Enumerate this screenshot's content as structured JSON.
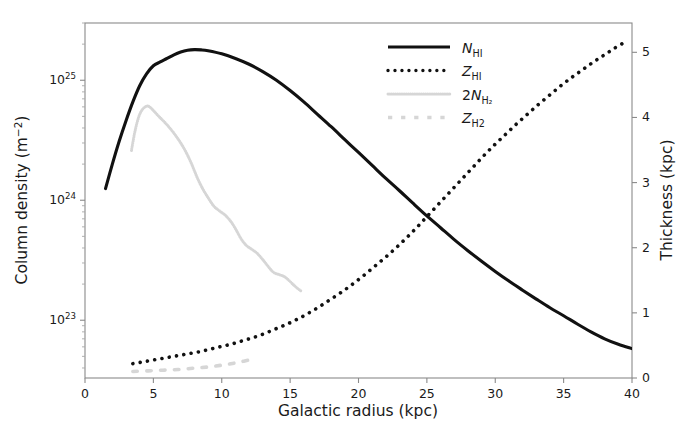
{
  "figure": {
    "background_color": "#ffffff",
    "frame_color": "#8a8a8a",
    "width": 690,
    "height": 427
  },
  "axes": {
    "x": {
      "label": "Galactic radius (kpc)",
      "min": 0,
      "max": 40,
      "ticks": [
        0,
        5,
        10,
        15,
        20,
        25,
        30,
        35,
        40
      ],
      "ticklabels": [
        "0",
        "5",
        "10",
        "15",
        "20",
        "25",
        "30",
        "35",
        "40"
      ],
      "scale": "linear"
    },
    "y_left": {
      "label_main": "Column density (m",
      "label_sup": "−2",
      "label_close": ")",
      "label_full": "Column density (m−2)",
      "scale": "log",
      "min": 3.3e+22,
      "max": 3e+25,
      "ticks": [
        1e+23,
        1e+24,
        1e+25
      ],
      "ticklabels": [
        {
          "mantissa": "10",
          "exponent": "23"
        },
        {
          "mantissa": "10",
          "exponent": "24"
        },
        {
          "mantissa": "10",
          "exponent": "25"
        }
      ]
    },
    "y_right": {
      "label": "Thickness (kpc)",
      "scale": "linear",
      "min": 0,
      "max": 5.45,
      "ticks": [
        0,
        1,
        2,
        3,
        4,
        5
      ],
      "ticklabels": [
        "0",
        "1",
        "2",
        "3",
        "4",
        "5"
      ]
    }
  },
  "legend": {
    "position": "upper-center-right",
    "frame": false,
    "entries": [
      {
        "name": "N_HI",
        "symbol_italic": "N",
        "symbol_sub": "HI",
        "style": "solid",
        "color": "#111111",
        "linewidth": 3.0,
        "axis": "left"
      },
      {
        "name": "Z_HI",
        "symbol_italic": "Z",
        "symbol_sub": "HI",
        "style": "dotted",
        "color": "#111111",
        "linewidth": 3.4,
        "axis": "right"
      },
      {
        "name": "2N_H2",
        "symbol_prefix": "2",
        "symbol_italic": "N",
        "symbol_sub": "H₂",
        "style": "dense-dotted",
        "color": "#d6d6d6",
        "linewidth": 3.0,
        "axis": "left"
      },
      {
        "name": "Z_H2",
        "symbol_italic": "Z",
        "symbol_sub": "H2",
        "style": "dashed",
        "color": "#d6d6d6",
        "linewidth": 3.4,
        "axis": "right"
      }
    ]
  },
  "chart_data": {
    "type": "line",
    "title": "",
    "xlabel": "Galactic radius (kpc)",
    "ylabel": "Column density (m^-2)",
    "ylabel_right": "Thickness (kpc)",
    "xlim": [
      0,
      40
    ],
    "ylim_left_log": [
      3.3e+22,
      3e+25
    ],
    "ylim_right": [
      0,
      5.45
    ],
    "grid": false,
    "legend_position": "upper right",
    "series": [
      {
        "name": "N_HI",
        "label": "N_HI",
        "axis": "left",
        "style": "solid",
        "color": "#111111",
        "x": [
          1.5,
          2.0,
          2.5,
          3.0,
          3.5,
          4.0,
          4.5,
          5.0,
          5.5,
          6.0,
          6.5,
          7.0,
          7.5,
          8.0,
          8.5,
          9.0,
          10.0,
          11.0,
          12.0,
          13.0,
          14.0,
          15.0,
          16.0,
          17.0,
          18.0,
          19.0,
          20.0,
          21.0,
          22.0,
          23.0,
          24.0,
          25.0,
          26.0,
          27.0,
          28.0,
          29.0,
          30.0,
          31.0,
          32.0,
          33.0,
          34.0,
          35.0,
          36.0,
          37.0,
          38.0,
          39.0,
          40.0
        ],
        "y": [
          1.25e+24,
          2e+24,
          3.1e+24,
          4.6e+24,
          6.6e+24,
          9e+24,
          1.13e+25,
          1.32e+25,
          1.42e+25,
          1.52e+25,
          1.63e+25,
          1.72e+25,
          1.78e+25,
          1.8e+25,
          1.79e+25,
          1.76e+25,
          1.66e+25,
          1.52e+25,
          1.36e+25,
          1.18e+25,
          1e+25,
          8.2e+24,
          6.6e+24,
          5.2e+24,
          4.1e+24,
          3.2e+24,
          2.5e+24,
          1.95e+24,
          1.52e+24,
          1.2e+24,
          9.4e+23,
          7.4e+23,
          5.9e+23,
          4.7e+23,
          3.8e+23,
          3.1e+23,
          2.55e+23,
          2.12e+23,
          1.78e+23,
          1.5e+23,
          1.27e+23,
          1.09e+23,
          9.3e+22,
          8e+22,
          7e+22,
          6.3e+22,
          5.8e+22
        ]
      },
      {
        "name": "Z_HI",
        "label": "Z_HI",
        "axis": "right",
        "style": "dotted",
        "color": "#111111",
        "x": [
          3.5,
          4.3,
          5.1,
          5.9,
          6.7,
          7.5,
          8.3,
          9.1,
          9.9,
          10.7,
          11.5,
          12.3,
          13.1,
          13.9,
          14.7,
          15.5,
          16.3,
          17.1,
          17.9,
          18.7,
          19.5,
          20.3,
          21.1,
          21.9,
          22.7,
          23.5,
          24.3,
          25.1,
          25.9,
          26.7,
          27.5,
          28.3,
          29.1,
          29.9,
          30.7,
          31.5,
          32.3,
          33.1,
          33.9,
          34.7,
          35.5,
          36.3,
          37.1,
          37.9,
          38.7,
          39.5
        ],
        "y": [
          0.22,
          0.25,
          0.28,
          0.31,
          0.34,
          0.37,
          0.4,
          0.44,
          0.48,
          0.52,
          0.57,
          0.62,
          0.68,
          0.75,
          0.82,
          0.9,
          0.99,
          1.09,
          1.2,
          1.31,
          1.43,
          1.56,
          1.7,
          1.84,
          1.99,
          2.15,
          2.32,
          2.5,
          2.68,
          2.86,
          3.04,
          3.22,
          3.4,
          3.57,
          3.73,
          3.89,
          4.04,
          4.19,
          4.33,
          4.47,
          4.6,
          4.72,
          4.84,
          4.95,
          5.06,
          5.16
        ]
      },
      {
        "name": "2N_H2",
        "label": "2N_H2",
        "axis": "left",
        "style": "dense-dotted",
        "color": "#d6d6d6",
        "x": [
          3.4,
          3.6,
          3.8,
          4.0,
          4.2,
          4.4,
          4.6,
          4.8,
          5.0,
          5.4,
          5.8,
          6.2,
          6.6,
          7.0,
          7.4,
          7.8,
          8.2,
          8.6,
          9.0,
          9.4,
          9.8,
          10.2,
          10.6,
          11.0,
          11.4,
          11.8,
          12.2,
          12.6,
          13.0,
          13.4,
          13.8,
          14.2,
          14.6,
          15.0,
          15.4,
          15.8
        ],
        "y": [
          2.6e+24,
          3.5e+24,
          4.4e+24,
          5.2e+24,
          5.7e+24,
          6e+24,
          6.1e+24,
          5.9e+24,
          5.6e+24,
          5e+24,
          4.5e+24,
          4e+24,
          3.5e+24,
          3e+24,
          2.5e+24,
          2e+24,
          1.55e+24,
          1.25e+24,
          1.05e+24,
          9e+23,
          8.2e+23,
          7.6e+23,
          6.8e+23,
          5.8e+23,
          4.8e+23,
          4.2e+23,
          3.9e+23,
          3.6e+23,
          3.2e+23,
          2.8e+23,
          2.5e+23,
          2.4e+23,
          2.3e+23,
          2.1e+23,
          1.9e+23,
          1.75e+23
        ]
      },
      {
        "name": "Z_H2",
        "label": "Z_H2",
        "axis": "right",
        "style": "dashed",
        "color": "#d6d6d6",
        "x": [
          3.5,
          4.6,
          5.7,
          6.8,
          7.9,
          9.0,
          10.1,
          11.2,
          12.3
        ],
        "y": [
          0.1,
          0.11,
          0.12,
          0.13,
          0.15,
          0.17,
          0.2,
          0.24,
          0.29
        ]
      }
    ]
  }
}
